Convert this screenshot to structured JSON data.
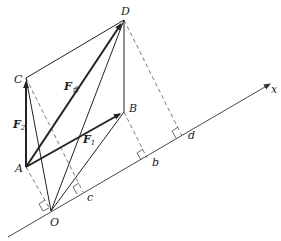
{
  "diagram": {
    "points": {
      "D": {
        "label": "D",
        "x": 124,
        "y": 20
      },
      "C": {
        "label": "C",
        "x": 26,
        "y": 78
      },
      "B": {
        "label": "B",
        "x": 124,
        "y": 112
      },
      "A": {
        "label": "A",
        "x": 26,
        "y": 167
      },
      "O": {
        "label": "O",
        "x": 51,
        "y": 211
      },
      "c": {
        "label": "c",
        "x": 83,
        "y": 192
      },
      "b": {
        "label": "b",
        "x": 147,
        "y": 158
      },
      "d": {
        "label": "d",
        "x": 182,
        "y": 136
      }
    },
    "axis": {
      "label": "x",
      "from": [
        8,
        237
      ],
      "to": [
        272,
        83
      ]
    },
    "vectors": {
      "F1": {
        "label": "F",
        "sub": "1",
        "from": "A",
        "to": "B"
      },
      "F2": {
        "label": "F",
        "sub": "2",
        "from": "A",
        "to": "C"
      },
      "Fsum": {
        "label": "F",
        "sub": "合",
        "from": "A",
        "to": "D"
      }
    },
    "colors": {
      "stroke": "#222222",
      "dashed": "#555555",
      "background": "#ffffff"
    }
  }
}
